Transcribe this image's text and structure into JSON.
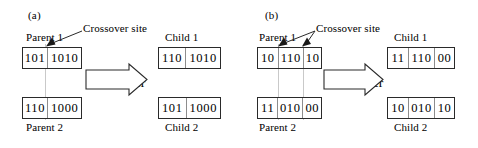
{
  "figure": {
    "width": 478,
    "height": 148,
    "background": "#ffffff",
    "line_color": "#2a2a2a",
    "divider_color": "#8d8d8d",
    "guide_color": "#c9c9c9"
  },
  "panels": [
    {
      "id": "a",
      "label": "(a)",
      "crossover_site_label": "Crossover site",
      "operator_label": "Crossover",
      "num_sites": 1,
      "parents": [
        {
          "caption": "Parent 1",
          "caption_position": "above",
          "segments": [
            "101",
            "1010"
          ],
          "string": "1011010"
        },
        {
          "caption": "Parent 2",
          "caption_position": "below",
          "segments": [
            "110",
            "1000"
          ],
          "string": "1101000"
        }
      ],
      "children": [
        {
          "caption": "Child 1",
          "caption_position": "above",
          "segments": [
            "110",
            "1010"
          ],
          "string": "1101010"
        },
        {
          "caption": "Child 2",
          "caption_position": "below",
          "segments": [
            "101",
            "1000"
          ],
          "string": "1011000"
        }
      ]
    },
    {
      "id": "b",
      "label": "(b)",
      "crossover_site_label": "Crossover site",
      "operator_label": "Crossover",
      "num_sites": 2,
      "parents": [
        {
          "caption": "Parent 1",
          "caption_position": "above",
          "segments": [
            "10",
            "110",
            "10"
          ],
          "string": "1011010"
        },
        {
          "caption": "Parent 2",
          "caption_position": "below",
          "segments": [
            "11",
            "010",
            "00"
          ],
          "string": "1101000"
        }
      ],
      "children": [
        {
          "caption": "Child 1",
          "caption_position": "above",
          "segments": [
            "11",
            "110",
            "00"
          ],
          "string": "1111000"
        },
        {
          "caption": "Child 2",
          "caption_position": "below",
          "segments": [
            "10",
            "010",
            "10"
          ],
          "string": "1001010"
        }
      ]
    }
  ]
}
